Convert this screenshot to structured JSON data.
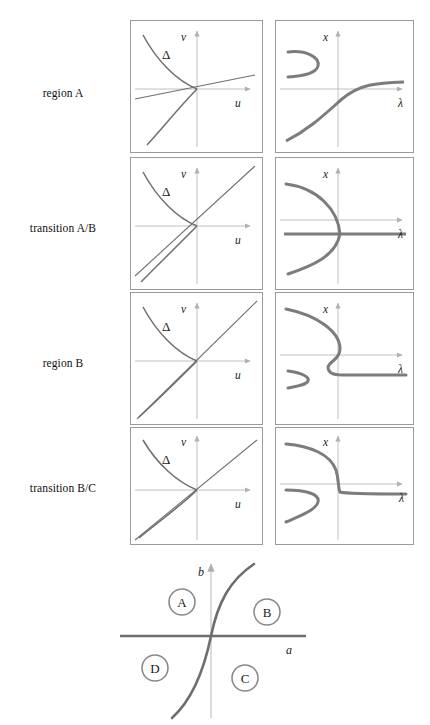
{
  "figure": {
    "type": "mathematical-bifurcation-diagram",
    "curve_color": "#7c7c7c",
    "axis_color": "#b9b9b9",
    "line_color": "#6e6e6e",
    "frame_color": "#9a9a9a"
  },
  "rows": [
    {
      "label": "region A",
      "left": {
        "axis_x_label": "u",
        "axis_y_label": "v",
        "curve_label": "Δ",
        "description": "cusp curve with line of small positive slope crossing near origin"
      },
      "right": {
        "axis_x_label": "λ",
        "axis_y_label": "x",
        "description": "single monotone increasing S branch plus detached left-opening fold above axis"
      }
    },
    {
      "label": "transition A/B",
      "left": {
        "axis_x_label": "u",
        "axis_y_label": "v",
        "curve_label": "Δ",
        "description": "line tangent to lower branch of cusp curve"
      },
      "right": {
        "axis_x_label": "λ",
        "axis_y_label": "x",
        "description": "left-opening parabola touching a horizontal straight branch"
      }
    },
    {
      "label": "region B",
      "left": {
        "axis_x_label": "u",
        "axis_y_label": "v",
        "curve_label": "Δ",
        "description": "steeper line crossing lower cusp branch twice"
      },
      "right": {
        "axis_x_label": "λ",
        "axis_y_label": "x",
        "description": "S shaped fold branch joining horizontal branch, small detached fold lower left"
      }
    },
    {
      "label": "transition B/C",
      "left": {
        "axis_x_label": "u",
        "axis_y_label": "v",
        "curve_label": "Δ",
        "description": "line tangent to cusp branch at origin"
      },
      "right": {
        "axis_x_label": "λ",
        "axis_y_label": "x",
        "description": "upper branch descending steeply to horizontal branch at origin, detached fold lower left"
      }
    }
  ],
  "parameter_diagram": {
    "axis_x_label": "a",
    "axis_y_label": "b",
    "regions": [
      {
        "id": "A",
        "position": "upper-left"
      },
      {
        "id": "B",
        "position": "upper-right"
      },
      {
        "id": "C",
        "position": "lower-right"
      },
      {
        "id": "D",
        "position": "lower-left"
      }
    ],
    "curve_description": "cubic-like separatrix through the origin rising steeply to the right"
  }
}
